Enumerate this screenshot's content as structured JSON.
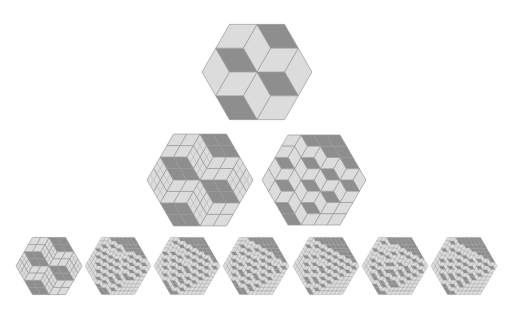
{
  "figure": {
    "colors": {
      "background": "#ffffff",
      "light": "#dcdcdc",
      "dark": "#8e8e8e",
      "edge": "#9a9a9a"
    },
    "tilings": [
      {
        "id": "top",
        "cx": 257,
        "cy": 72,
        "size": 2,
        "side_px": 55,
        "heights": [
          [
            2,
            1
          ],
          [
            1,
            0
          ]
        ]
      },
      {
        "id": "middle-left",
        "cx": 200,
        "cy": 180,
        "size": 4,
        "side_px": 53,
        "subdivide": 2,
        "heights": [
          [
            4,
            4,
            2,
            2
          ],
          [
            4,
            4,
            2,
            2
          ],
          [
            2,
            2,
            0,
            0
          ],
          [
            2,
            2,
            0,
            0
          ]
        ]
      },
      {
        "id": "middle-right",
        "cx": 314,
        "cy": 180,
        "size": 4,
        "side_px": 52,
        "heights": [
          [
            4,
            3,
            2,
            1
          ],
          [
            3,
            2,
            1,
            1
          ],
          [
            2,
            1,
            1,
            0
          ],
          [
            1,
            1,
            0,
            0
          ]
        ]
      },
      {
        "id": "bottom-1",
        "cx": 49,
        "cy": 266,
        "size": 4,
        "side_px": 33,
        "subdivide": 2,
        "heights": [
          [
            4,
            4,
            2,
            2
          ],
          [
            4,
            4,
            2,
            2
          ],
          [
            2,
            2,
            0,
            0
          ],
          [
            2,
            2,
            0,
            0
          ]
        ]
      },
      {
        "id": "bottom-2",
        "cx": 118,
        "cy": 266,
        "size": 8,
        "side_px": 33,
        "heights": [
          [
            8,
            8,
            7,
            6,
            4,
            4,
            3,
            2
          ],
          [
            8,
            7,
            6,
            5,
            4,
            3,
            2,
            2
          ],
          [
            7,
            6,
            5,
            4,
            4,
            3,
            2,
            1
          ],
          [
            6,
            5,
            4,
            4,
            3,
            2,
            1,
            0
          ],
          [
            4,
            4,
            4,
            3,
            2,
            1,
            0,
            0
          ],
          [
            4,
            3,
            3,
            2,
            1,
            0,
            0,
            0
          ],
          [
            3,
            2,
            2,
            1,
            0,
            0,
            0,
            0
          ],
          [
            2,
            2,
            1,
            0,
            0,
            0,
            0,
            0
          ]
        ]
      },
      {
        "id": "bottom-3",
        "cx": 187,
        "cy": 266,
        "size": 8,
        "side_px": 33,
        "heights": [
          [
            8,
            7,
            7,
            6,
            5,
            4,
            3,
            2
          ],
          [
            7,
            7,
            6,
            5,
            4,
            3,
            2,
            1
          ],
          [
            7,
            6,
            5,
            4,
            3,
            3,
            2,
            1
          ],
          [
            6,
            5,
            4,
            4,
            3,
            2,
            1,
            1
          ],
          [
            5,
            4,
            3,
            3,
            2,
            1,
            1,
            0
          ],
          [
            4,
            3,
            3,
            2,
            1,
            1,
            0,
            0
          ],
          [
            3,
            2,
            2,
            1,
            1,
            0,
            0,
            0
          ],
          [
            2,
            1,
            1,
            1,
            0,
            0,
            0,
            0
          ]
        ]
      },
      {
        "id": "bottom-4",
        "cx": 256,
        "cy": 266,
        "size": 8,
        "side_px": 33,
        "heights": [
          [
            8,
            7,
            6,
            6,
            5,
            4,
            3,
            2
          ],
          [
            7,
            7,
            6,
            5,
            4,
            3,
            3,
            2
          ],
          [
            6,
            6,
            5,
            4,
            4,
            3,
            2,
            1
          ],
          [
            6,
            5,
            4,
            4,
            3,
            2,
            1,
            1
          ],
          [
            5,
            4,
            4,
            3,
            2,
            2,
            1,
            0
          ],
          [
            4,
            3,
            3,
            2,
            2,
            1,
            0,
            0
          ],
          [
            3,
            3,
            2,
            1,
            1,
            0,
            0,
            0
          ],
          [
            2,
            2,
            1,
            1,
            0,
            0,
            0,
            0
          ]
        ]
      },
      {
        "id": "bottom-5",
        "cx": 326,
        "cy": 266,
        "size": 8,
        "side_px": 33,
        "heights": [
          [
            8,
            7,
            6,
            5,
            4,
            3,
            2,
            1
          ],
          [
            7,
            6,
            5,
            4,
            3,
            2,
            1,
            1
          ],
          [
            6,
            5,
            4,
            3,
            2,
            2,
            1,
            0
          ],
          [
            5,
            4,
            3,
            3,
            2,
            1,
            1,
            0
          ],
          [
            4,
            3,
            2,
            2,
            1,
            1,
            0,
            0
          ],
          [
            3,
            2,
            2,
            1,
            1,
            0,
            0,
            0
          ],
          [
            2,
            1,
            1,
            1,
            0,
            0,
            0,
            0
          ],
          [
            1,
            1,
            0,
            0,
            0,
            0,
            0,
            0
          ]
        ]
      },
      {
        "id": "bottom-6",
        "cx": 395,
        "cy": 266,
        "size": 8,
        "side_px": 33,
        "heights": [
          [
            8,
            8,
            7,
            6,
            5,
            4,
            2,
            2
          ],
          [
            8,
            7,
            6,
            5,
            4,
            4,
            2,
            1
          ],
          [
            7,
            6,
            6,
            5,
            4,
            3,
            2,
            1
          ],
          [
            6,
            5,
            5,
            4,
            4,
            2,
            1,
            0
          ],
          [
            5,
            4,
            4,
            4,
            2,
            2,
            1,
            0
          ],
          [
            4,
            4,
            3,
            2,
            2,
            1,
            0,
            0
          ],
          [
            2,
            2,
            2,
            1,
            1,
            0,
            0,
            0
          ],
          [
            2,
            1,
            1,
            0,
            0,
            0,
            0,
            0
          ]
        ]
      },
      {
        "id": "bottom-7",
        "cx": 464,
        "cy": 266,
        "size": 8,
        "side_px": 33,
        "heights": [
          [
            8,
            7,
            6,
            5,
            4,
            3,
            2,
            2
          ],
          [
            7,
            6,
            5,
            5,
            4,
            3,
            2,
            1
          ],
          [
            6,
            5,
            5,
            4,
            3,
            2,
            1,
            1
          ],
          [
            5,
            5,
            4,
            3,
            2,
            2,
            1,
            0
          ],
          [
            4,
            4,
            3,
            2,
            2,
            1,
            1,
            0
          ],
          [
            3,
            3,
            2,
            2,
            1,
            1,
            0,
            0
          ],
          [
            2,
            2,
            1,
            1,
            1,
            0,
            0,
            0
          ],
          [
            2,
            1,
            1,
            0,
            0,
            0,
            0,
            0
          ]
        ]
      }
    ]
  }
}
